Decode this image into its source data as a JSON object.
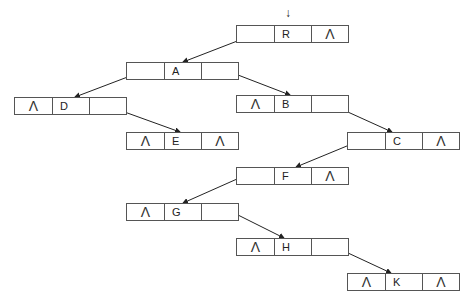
{
  "diagram": {
    "type": "threaded binary tree (linked representation)",
    "null_symbol": "Λ",
    "root_pointer_symbol": "↓",
    "nodes": [
      {
        "id": "R",
        "key": "R",
        "left": "",
        "right": "Λ",
        "x": 236,
        "y": 25
      },
      {
        "id": "A",
        "key": "A",
        "left": "",
        "right": "",
        "x": 126,
        "y": 62
      },
      {
        "id": "D",
        "key": "D",
        "left": "Λ",
        "right": "",
        "x": 14,
        "y": 97
      },
      {
        "id": "B",
        "key": "B",
        "left": "Λ",
        "right": "",
        "x": 236,
        "y": 95
      },
      {
        "id": "E",
        "key": "E",
        "left": "Λ",
        "right": "Λ",
        "x": 126,
        "y": 132
      },
      {
        "id": "C",
        "key": "C",
        "left": "",
        "right": "Λ",
        "x": 347,
        "y": 132
      },
      {
        "id": "F",
        "key": "F",
        "left": "",
        "right": "Λ",
        "x": 236,
        "y": 167
      },
      {
        "id": "G",
        "key": "G",
        "left": "Λ",
        "right": "",
        "x": 126,
        "y": 203
      },
      {
        "id": "H",
        "key": "H",
        "left": "Λ",
        "right": "",
        "x": 236,
        "y": 238
      },
      {
        "id": "K",
        "key": "K",
        "left": "Λ",
        "right": "Λ",
        "x": 347,
        "y": 273
      }
    ],
    "edges": [
      {
        "from": "R",
        "side": "left",
        "to": "A",
        "x1": 258,
        "y1": 33,
        "x2": 183,
        "y2": 62
      },
      {
        "from": "A",
        "side": "left",
        "to": "D",
        "x1": 146,
        "y1": 70,
        "x2": 75,
        "y2": 97
      },
      {
        "from": "A",
        "side": "right",
        "to": "B",
        "x1": 225,
        "y1": 70,
        "x2": 290,
        "y2": 95
      },
      {
        "from": "D",
        "side": "right",
        "to": "E",
        "x1": 108,
        "y1": 106,
        "x2": 180,
        "y2": 132
      },
      {
        "from": "B",
        "side": "right",
        "to": "C",
        "x1": 328,
        "y1": 103,
        "x2": 392,
        "y2": 132
      },
      {
        "from": "C",
        "side": "left",
        "to": "F",
        "x1": 359,
        "y1": 141,
        "x2": 296,
        "y2": 167
      },
      {
        "from": "F",
        "side": "left",
        "to": "G",
        "x1": 246,
        "y1": 175,
        "x2": 183,
        "y2": 203
      },
      {
        "from": "G",
        "side": "right",
        "to": "H",
        "x1": 232,
        "y1": 212,
        "x2": 284,
        "y2": 238
      },
      {
        "from": "H",
        "side": "right",
        "to": "K",
        "x1": 333,
        "y1": 246,
        "x2": 391,
        "y2": 273
      }
    ]
  }
}
